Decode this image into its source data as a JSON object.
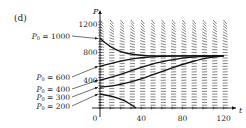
{
  "panel_label": "(d)",
  "chart_data": {
    "type": "line",
    "subtype": "direction field with solution curves",
    "title": "",
    "xlabel": "t",
    "ylabel": "P",
    "xlim": [
      0,
      125
    ],
    "ylim": [
      0,
      1300
    ],
    "x_ticks": [
      0,
      40,
      80,
      120
    ],
    "x_tick_labels": [
      "0",
      "40",
      "80",
      "120"
    ],
    "y_ticks": [
      400,
      800,
      1200
    ],
    "y_tick_labels": [
      "400",
      "800",
      "1200"
    ],
    "grid": false,
    "legend": "none; curves annotated by arrows at left",
    "equilibrium": 750,
    "series": [
      {
        "name": "P₀ = 1000",
        "label_left": "P",
        "label_sub": "0",
        "label_rest": " = 1000",
        "t": [
          0,
          10,
          20,
          30,
          40,
          50,
          60,
          80,
          100,
          120
        ],
        "P": [
          1000,
          880,
          810,
          775,
          760,
          752,
          750,
          750,
          750,
          750
        ]
      },
      {
        "name": "P₀ = 600",
        "label_left": "P",
        "label_sub": "0",
        "label_rest": " = 600",
        "t": [
          0,
          10,
          20,
          30,
          40,
          50,
          60,
          80,
          100,
          120
        ],
        "P": [
          600,
          640,
          675,
          705,
          725,
          738,
          745,
          750,
          750,
          750
        ]
      },
      {
        "name": "P₀ = 400",
        "label_left": "P",
        "label_sub": "0",
        "label_rest": " = 400",
        "t": [
          0,
          10,
          20,
          30,
          40,
          50,
          60,
          80,
          100,
          120
        ],
        "P": [
          400,
          440,
          485,
          535,
          585,
          630,
          670,
          720,
          745,
          750
        ]
      },
      {
        "name": "P₀ = 300",
        "label_left": "P",
        "label_sub": "0",
        "label_rest": " = 300",
        "t": [
          0,
          10,
          20,
          30,
          40,
          50,
          60,
          80,
          100,
          110,
          120
        ],
        "P": [
          300,
          315,
          340,
          375,
          420,
          470,
          525,
          630,
          710,
          735,
          748
        ]
      },
      {
        "name": "P₀ = 200",
        "label_left": "P",
        "label_sub": "0",
        "label_rest": " = 200",
        "t": [
          0,
          10,
          20,
          25,
          30,
          35
        ],
        "P": [
          200,
          175,
          130,
          95,
          50,
          0
        ]
      }
    ]
  }
}
